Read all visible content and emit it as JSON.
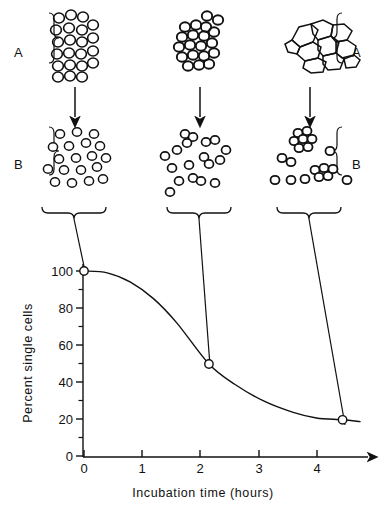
{
  "figure": {
    "line_color": "#111111",
    "background": "#ffffff"
  },
  "panels": {
    "row_a": {
      "label_left": "A",
      "label_right": "A",
      "description": "Intact tissue / aggregated cells before dissociation",
      "items": [
        {
          "name": "tissue-0h",
          "style": "loose-round-cells",
          "time_hours": 0
        },
        {
          "name": "tissue-2h",
          "style": "packed-round-cells",
          "time_hours": 2.15
        },
        {
          "name": "tissue-4h",
          "style": "polygonal-epithelial-sheet",
          "time_hours": 4.45
        }
      ]
    },
    "row_b": {
      "label_left": "B",
      "label_right": "B",
      "description": "Cell suspension after dissociation",
      "items": [
        {
          "name": "suspension-0h",
          "clumps": 0,
          "singles": 19,
          "percent_single": 100
        },
        {
          "name": "suspension-2h",
          "clumps": 4,
          "singles": 13,
          "percent_single": 50
        },
        {
          "name": "suspension-4h",
          "clumps": 3,
          "singles": 8,
          "percent_single": 20
        }
      ]
    },
    "arrow_label": "downward-arrow"
  },
  "chart_data": {
    "type": "line",
    "title": "",
    "xlabel": "Incubation time (hours)",
    "ylabel": "Percent single cells",
    "xlim": [
      0,
      4.75
    ],
    "ylim": [
      0,
      105
    ],
    "xticks": [
      0,
      1,
      2,
      3,
      4
    ],
    "xticklabels": [
      "0",
      "1",
      "2",
      "3",
      "4"
    ],
    "yticks": [
      0,
      20,
      40,
      60,
      80,
      100
    ],
    "yticklabels": [
      "0",
      "20",
      "40",
      "60",
      "80",
      "100"
    ],
    "minor_yticks": [
      10,
      30,
      50,
      70,
      90
    ],
    "grid": false,
    "legend": false,
    "marker": "open-circle",
    "x": [
      0,
      2.15,
      4.45
    ],
    "values": [
      100,
      50,
      20
    ],
    "series": [
      {
        "name": "Percent single cells",
        "x": [
          0,
          2.15,
          4.45
        ],
        "values": [
          100,
          50,
          20
        ]
      }
    ],
    "curve_points": [
      [
        0,
        100
      ],
      [
        0.4,
        99
      ],
      [
        0.8,
        94
      ],
      [
        1.2,
        85
      ],
      [
        1.6,
        72
      ],
      [
        2.15,
        50
      ],
      [
        2.6,
        39
      ],
      [
        3.1,
        30
      ],
      [
        3.6,
        24
      ],
      [
        4.0,
        21
      ],
      [
        4.45,
        20
      ],
      [
        4.75,
        19
      ]
    ],
    "annotations": [
      {
        "text": "100",
        "at": [
          0,
          100
        ],
        "kind": "datapoint"
      },
      {
        "text": "50",
        "at": [
          2.15,
          50
        ],
        "kind": "datapoint"
      },
      {
        "text": "20",
        "at": [
          4.45,
          20
        ],
        "kind": "datapoint"
      }
    ]
  }
}
